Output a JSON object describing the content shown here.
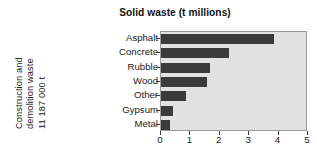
{
  "chart_data": {
    "type": "bar",
    "orientation": "horizontal",
    "title": "Solid waste (t millions)",
    "xlabel": "",
    "ylabel": "",
    "xlim": [
      0,
      5
    ],
    "xticks": [
      "0",
      "1",
      "2",
      "3",
      "4",
      "5"
    ],
    "grid": false,
    "legend": null,
    "bar_color": "#3b3b3b",
    "plot_background": "#e2e2e2",
    "categories": [
      "Asphalt",
      "Concrete",
      "Rubble",
      "Wood",
      "Other",
      "Gypsum",
      "Metal"
    ],
    "values": [
      3.85,
      2.3,
      1.65,
      1.55,
      0.85,
      0.4,
      0.3
    ],
    "side_label": {
      "line1": "Construction and",
      "line2": "demolition waste",
      "line3": "11 187 000 t"
    }
  }
}
